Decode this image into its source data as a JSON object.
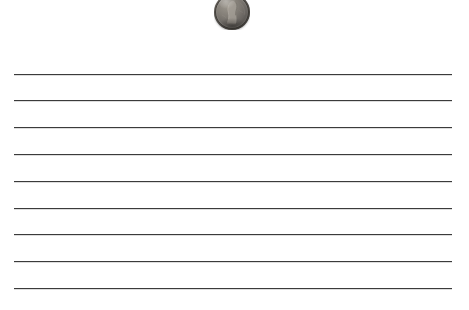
{
  "scene": {
    "title": "Penny on ruled notebook paper",
    "width": 469,
    "height": 310,
    "background_color": "#ffffff"
  },
  "coin": {
    "name": "penny",
    "description": "United States one-cent coin, Lincoln obverse, shown in grayscale",
    "alt_text": "Penny",
    "position": {
      "left": 214,
      "top": -6,
      "width": 36,
      "height": 36
    },
    "clip": {
      "left": 214,
      "top": 0,
      "width": 36,
      "height": 30
    },
    "cut_off_at_top": true,
    "colors": {
      "highlight": "#9b968f",
      "midtone": "#78736d",
      "shadow": "#4a4743",
      "rim": "#3a3733"
    }
  },
  "ruled_lines": {
    "count": 9,
    "color": "#2b2b2b",
    "thickness_px": 1,
    "x_start": 14,
    "x_end": 452,
    "spacing_px": 26.7,
    "y_positions": [
      74,
      100,
      127,
      154,
      181,
      208,
      234,
      261,
      288
    ]
  }
}
